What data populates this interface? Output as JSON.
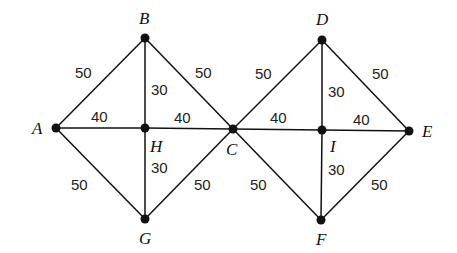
{
  "diagram": {
    "type": "weighted-undirected-graph",
    "nodes": [
      {
        "id": "A",
        "x": 56,
        "y": 128,
        "lx": 32,
        "ly": 134
      },
      {
        "id": "B",
        "x": 145,
        "y": 38,
        "lx": 139,
        "ly": 24
      },
      {
        "id": "H",
        "x": 145,
        "y": 128,
        "lx": 150,
        "ly": 152
      },
      {
        "id": "G",
        "x": 145,
        "y": 219,
        "lx": 139,
        "ly": 244
      },
      {
        "id": "C",
        "x": 233,
        "y": 129,
        "lx": 226,
        "ly": 155
      },
      {
        "id": "D",
        "x": 322,
        "y": 40,
        "lx": 316,
        "ly": 25
      },
      {
        "id": "I",
        "x": 322,
        "y": 130,
        "lx": 330,
        "ly": 152
      },
      {
        "id": "E",
        "x": 409,
        "y": 131,
        "lx": 422,
        "ly": 137
      },
      {
        "id": "F",
        "x": 321,
        "y": 220,
        "lx": 316,
        "ly": 245
      }
    ],
    "edges": [
      {
        "from": "A",
        "to": "B",
        "weight": "50",
        "lx": 75,
        "ly": 78
      },
      {
        "from": "B",
        "to": "C",
        "weight": "50",
        "lx": 195,
        "ly": 78
      },
      {
        "from": "B",
        "to": "H",
        "weight": "30",
        "lx": 151,
        "ly": 95
      },
      {
        "from": "A",
        "to": "H",
        "weight": "40",
        "lx": 91,
        "ly": 122
      },
      {
        "from": "H",
        "to": "C",
        "weight": "40",
        "lx": 174,
        "ly": 123
      },
      {
        "from": "H",
        "to": "G",
        "weight": "30",
        "lx": 151,
        "ly": 173
      },
      {
        "from": "A",
        "to": "G",
        "weight": "50",
        "lx": 71,
        "ly": 190
      },
      {
        "from": "G",
        "to": "C",
        "weight": "50",
        "lx": 194,
        "ly": 190
      },
      {
        "from": "C",
        "to": "D",
        "weight": "50",
        "lx": 255,
        "ly": 79
      },
      {
        "from": "D",
        "to": "E",
        "weight": "50",
        "lx": 372,
        "ly": 79
      },
      {
        "from": "D",
        "to": "I",
        "weight": "30",
        "lx": 328,
        "ly": 97
      },
      {
        "from": "C",
        "to": "I",
        "weight": "40",
        "lx": 270,
        "ly": 123
      },
      {
        "from": "I",
        "to": "E",
        "weight": "40",
        "lx": 353,
        "ly": 125
      },
      {
        "from": "I",
        "to": "F",
        "weight": "30",
        "lx": 328,
        "ly": 175
      },
      {
        "from": "C",
        "to": "F",
        "weight": "50",
        "lx": 250,
        "ly": 190
      },
      {
        "from": "F",
        "to": "E",
        "weight": "50",
        "lx": 371,
        "ly": 190
      }
    ]
  }
}
